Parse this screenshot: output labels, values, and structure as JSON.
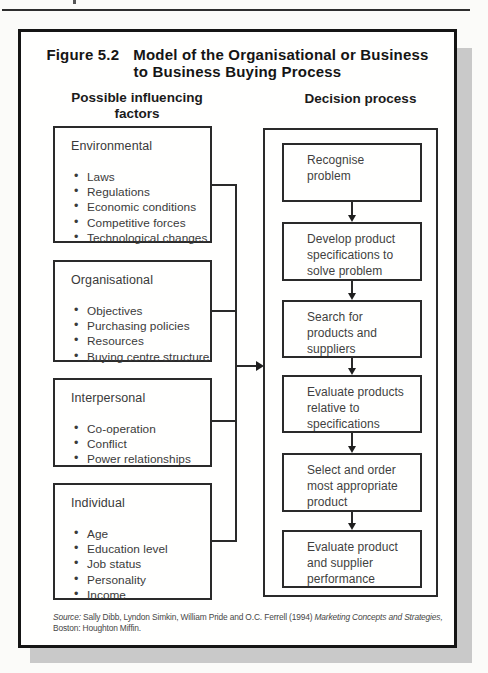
{
  "figure": {
    "label": "Figure 5.2",
    "title_line1": "Model of the Organisational or Business",
    "title_line2": "to Business Buying Process",
    "columns": {
      "left_header_line1": "Possible influencing",
      "left_header_line2": "factors",
      "right_header": "Decision process"
    },
    "factors": [
      {
        "heading": "Environmental",
        "items": [
          "Laws",
          "Regulations",
          "Economic conditions",
          "Competitive forces",
          "Technological changes"
        ]
      },
      {
        "heading": "Organisational",
        "items": [
          "Objectives",
          "Purchasing policies",
          "Resources",
          "Buying centre structure"
        ]
      },
      {
        "heading": "Interpersonal",
        "items": [
          "Co-operation",
          "Conflict",
          "Power relationships"
        ]
      },
      {
        "heading": "Individual",
        "items": [
          "Age",
          "Education level",
          "Job status",
          "Personality",
          "Income"
        ]
      }
    ],
    "process_steps": [
      "Recognise\nproblem",
      "Develop product\nspecifications to\nsolve problem",
      "Search for\nproducts and\nsuppliers",
      "Evaluate products\nrelative to\nspecifications",
      "Select and order\nmost appropriate\nproduct",
      "Evaluate product\nand supplier\nperformance"
    ],
    "source": {
      "prefix": "Source:",
      "authors": " Sally Dibb, Lyndon Simkin, William Pride and O.C. Ferrell (1994) ",
      "book": "Marketing Concepts and Strategies,",
      "line2": "Boston: Houghton Miffin."
    },
    "colors": {
      "ink": "#2a2a2a",
      "text": "#3a3a3a",
      "shadow": "#c9c9c9",
      "background": "#fffffe"
    }
  }
}
